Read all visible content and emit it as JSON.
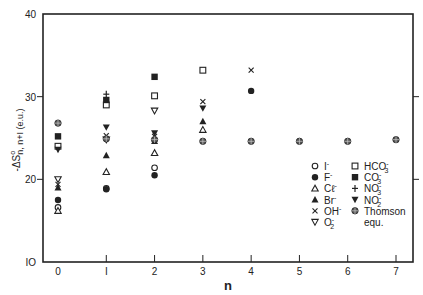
{
  "chart_data": {
    "type": "scatter",
    "title": "",
    "xlabel": "n",
    "ylabel": "-ΔS°n, n+1 (e.u.)",
    "ylabel_parts": {
      "main": "-ΔS",
      "sup": "o",
      "sub": "n, n+I (e.u.)"
    },
    "xlim": [
      -0.3,
      7.35
    ],
    "ylim": [
      10,
      40
    ],
    "xticks": [
      0,
      1,
      2,
      3,
      4,
      5,
      6,
      7
    ],
    "xtick_labels": [
      "0",
      "I",
      "2",
      "3",
      "4",
      "5",
      "6",
      "7"
    ],
    "yticks": [
      10,
      20,
      30,
      40
    ],
    "ytick_labels": [
      "IO",
      "20",
      "30",
      "40"
    ],
    "grid": false,
    "legend_position": "bottom-right",
    "series": [
      {
        "name": "I⁻",
        "label": "I",
        "sup": "-",
        "marker": "open-circle",
        "points": [
          [
            0,
            16.6
          ],
          [
            1,
            18.9
          ],
          [
            2,
            21.4
          ]
        ]
      },
      {
        "name": "F⁻",
        "label": "F",
        "sup": "-",
        "marker": "filled-circle",
        "points": [
          [
            0,
            17.5
          ],
          [
            1,
            18.8
          ],
          [
            2,
            20.5
          ],
          [
            4,
            30.7
          ]
        ]
      },
      {
        "name": "Cl⁻",
        "label": "Cℓ",
        "sup": "-",
        "marker": "open-triangle-up",
        "points": [
          [
            0,
            16.2
          ],
          [
            1,
            20.9
          ],
          [
            2,
            23.2
          ],
          [
            3,
            26.0
          ]
        ]
      },
      {
        "name": "Br⁻",
        "label": "Br",
        "sup": "-",
        "marker": "filled-triangle-up",
        "points": [
          [
            0,
            19.0
          ],
          [
            1,
            22.9
          ],
          [
            2,
            24.6
          ],
          [
            3,
            27.0
          ]
        ]
      },
      {
        "name": "OH⁻",
        "label": "OH",
        "sup": "-",
        "marker": "x",
        "points": [
          [
            0,
            19.4
          ],
          [
            1,
            25.3
          ],
          [
            2,
            25.2
          ],
          [
            3,
            29.4
          ],
          [
            4,
            33.2
          ]
        ]
      },
      {
        "name": "O₂⁻",
        "label": "O",
        "sub": "2",
        "sup": "-",
        "marker": "open-triangle-down",
        "points": [
          [
            0,
            20.0
          ],
          [
            1,
            24.8
          ],
          [
            2,
            28.3
          ]
        ]
      },
      {
        "name": "HCO₃⁻",
        "label": "HCO",
        "sub": "3",
        "sup": "-",
        "marker": "open-square",
        "points": [
          [
            0,
            24.0
          ],
          [
            1,
            29.0
          ],
          [
            2,
            30.1
          ],
          [
            3,
            33.2
          ]
        ]
      },
      {
        "name": "CO₃⁻",
        "label": "CO",
        "sub": "3",
        "sup": "-",
        "marker": "filled-square",
        "points": [
          [
            0,
            25.2
          ],
          [
            1,
            29.6
          ],
          [
            2,
            32.4
          ]
        ]
      },
      {
        "name": "NO₃⁻",
        "label": "NO",
        "sub": "3",
        "sup": "-",
        "marker": "plus",
        "points": [
          [
            1,
            30.3
          ]
        ]
      },
      {
        "name": "NO₂⁻",
        "label": "NO",
        "sub": "2",
        "sup": "-",
        "marker": "filled-triangle-down",
        "points": [
          [
            0,
            23.6
          ],
          [
            1,
            26.3
          ],
          [
            2,
            25.6
          ],
          [
            3,
            28.6
          ]
        ]
      },
      {
        "name": "Thomson equ.",
        "label": "Thomson",
        "label2": "equ.",
        "marker": "crossed-circle",
        "points": [
          [
            0,
            26.8
          ],
          [
            1,
            24.9
          ],
          [
            2,
            24.8
          ],
          [
            3,
            24.6
          ],
          [
            4,
            24.6
          ],
          [
            5,
            24.6
          ],
          [
            6,
            24.6
          ],
          [
            7,
            24.8
          ]
        ]
      }
    ],
    "legend_order": [
      [
        0,
        6
      ],
      [
        1,
        7
      ],
      [
        2,
        8
      ],
      [
        3,
        9
      ],
      [
        4,
        10
      ],
      [
        5,
        null
      ]
    ]
  }
}
